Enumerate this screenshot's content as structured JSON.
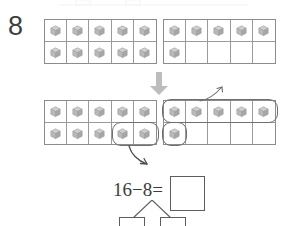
{
  "worksheet": {
    "problem_number": "8",
    "equation_text": "16−8=",
    "answer_value": "",
    "answer_placeholder": "",
    "bond_left_value": "",
    "bond_right_value": "",
    "transition_arrow_icon": "down-arrow-icon",
    "curve_up_icon": "curved-arrow-up-icon",
    "curve_down_icon": "curved-arrow-down-icon",
    "counter_icon": "cube-block-icon",
    "colors": {
      "cube_fill": "#b9b9b9",
      "cube_top": "#cfcfcf",
      "cube_side": "#a6a6a6",
      "grid_line": "#9a9a9a",
      "frame_border": "#8c8c8c",
      "loop_stroke": "#6f6f6f",
      "arrow_fill": "#bdbdbd",
      "ink": "#3d3d3d",
      "page_background": "#ffffff"
    },
    "frames": [
      {
        "id": "frame-a",
        "label": "top-left-ten-frame",
        "rows": 2,
        "columns": 5,
        "filled_count": 10,
        "cells": [
          true,
          true,
          true,
          true,
          true,
          true,
          true,
          true,
          true,
          true
        ]
      },
      {
        "id": "frame-b",
        "label": "top-right-ten-frame",
        "rows": 2,
        "columns": 5,
        "filled_count": 6,
        "cells": [
          true,
          true,
          true,
          true,
          true,
          true,
          false,
          false,
          false,
          false
        ]
      },
      {
        "id": "frame-c",
        "label": "bottom-left-ten-frame",
        "rows": 2,
        "columns": 5,
        "filled_count": 10,
        "cells": [
          true,
          true,
          true,
          true,
          true,
          true,
          true,
          true,
          true,
          true
        ]
      },
      {
        "id": "frame-d",
        "label": "bottom-right-ten-frame",
        "rows": 2,
        "columns": 5,
        "filled_count": 6,
        "cells": [
          true,
          true,
          true,
          true,
          true,
          true,
          false,
          false,
          false,
          false
        ]
      }
    ],
    "loops": [
      {
        "id": "loop-left",
        "label": "grouping-loop-two-cubes"
      },
      {
        "id": "loop-top-right",
        "label": "grouping-loop-five-cubes"
      },
      {
        "id": "loop-single",
        "label": "grouping-loop-one-cube"
      }
    ]
  }
}
